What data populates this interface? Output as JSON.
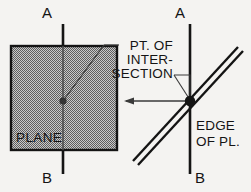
{
  "diagram": {
    "background_color": "#f4f3f1",
    "ink_color": "#141414",
    "plane_fill_color": "#9a9a9a",
    "labels": {
      "axis_top_left": "A",
      "axis_bottom_left": "B",
      "axis_top_right": "A",
      "axis_bottom_right": "B",
      "plane": "PLANE",
      "note_line_1": "PT. OF",
      "note_line_2": "INTER-",
      "note_line_3": "SECTION",
      "edge_line_1": "EDGE",
      "edge_line_2": "OF PL."
    },
    "icons": {
      "intersection_point": "intersection-dot-icon",
      "edge_intersection_node": "intersection-node-icon",
      "projection_arrow": "left-arrow-icon",
      "leader_plane": "leader-line-icon",
      "leader_edge": "leader-pointer-icon"
    },
    "geometry": {
      "plane_square": {
        "x": 11,
        "y": 46,
        "width": 106,
        "height": 104
      },
      "left_axis_x": 63,
      "right_axis_x": 190,
      "intersection_point": {
        "x": 63,
        "y": 101
      },
      "edge_node": {
        "x": 190,
        "y": 101
      },
      "edge_band_start": {
        "x": 133,
        "y": 161
      },
      "edge_band_end": {
        "x": 238,
        "y": 47
      },
      "arrow_tip": {
        "x": 124,
        "y": 101
      }
    }
  }
}
